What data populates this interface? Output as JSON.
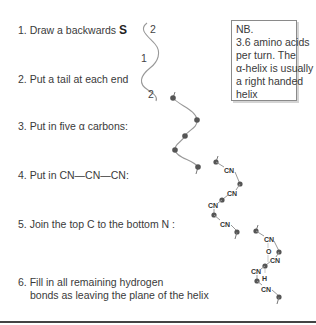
{
  "steps": [
    {
      "num": "1.",
      "text": "Draw a backwards",
      "emph": "S"
    },
    {
      "num": "2.",
      "text": "Put a tail at each end"
    },
    {
      "num": "3.",
      "text": "Put in five α carbons:"
    },
    {
      "num": "4.",
      "text": "Put in CN—CN—CN:"
    },
    {
      "num": "5.",
      "text": "Join the top  C  to the bottom  N :"
    },
    {
      "num": "6.",
      "line1": "Fill in all remaining hydrogen",
      "line2": "bonds as leaving the plane of the helix"
    }
  ],
  "note": {
    "lines": [
      "NB.",
      "3.6 amino acids",
      "per turn. The",
      "α-helix is usually",
      "a right handed",
      "helix"
    ]
  },
  "s_curve_labels": {
    "top": "2",
    "middle": "1",
    "bottom": "2"
  },
  "helix_labels": {
    "cn": "CN",
    "o": "O",
    "h": "H"
  },
  "colors": {
    "line": "#888888",
    "dot": "#555555",
    "text": "#3a3a3a"
  }
}
